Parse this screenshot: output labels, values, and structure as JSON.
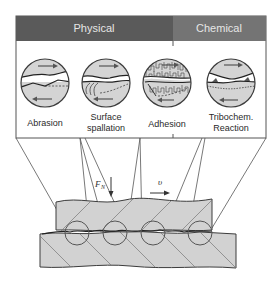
{
  "header": {
    "categories": [
      {
        "label": "Physical",
        "color": "#5a5a5a"
      },
      {
        "label": "Chemical",
        "color": "#747474"
      }
    ]
  },
  "mechanisms": [
    {
      "label_line1": "Abrasion",
      "label_line2": "",
      "category": "Physical"
    },
    {
      "label_line1": "Surface",
      "label_line2": "spallation",
      "category": "Physical"
    },
    {
      "label_line1": "Adhesion",
      "label_line2": "",
      "category": "Physical"
    },
    {
      "label_line1": "Tribochem.",
      "label_line2": "Reaction",
      "category": "Chemical"
    }
  ],
  "contact": {
    "normal_force_symbol": "F",
    "normal_force_subscript": "N",
    "velocity_symbol": "υ"
  },
  "colors": {
    "body_fill": "#d2d2d2",
    "outline": "#3c3c3c",
    "panel_border": "#555555"
  }
}
